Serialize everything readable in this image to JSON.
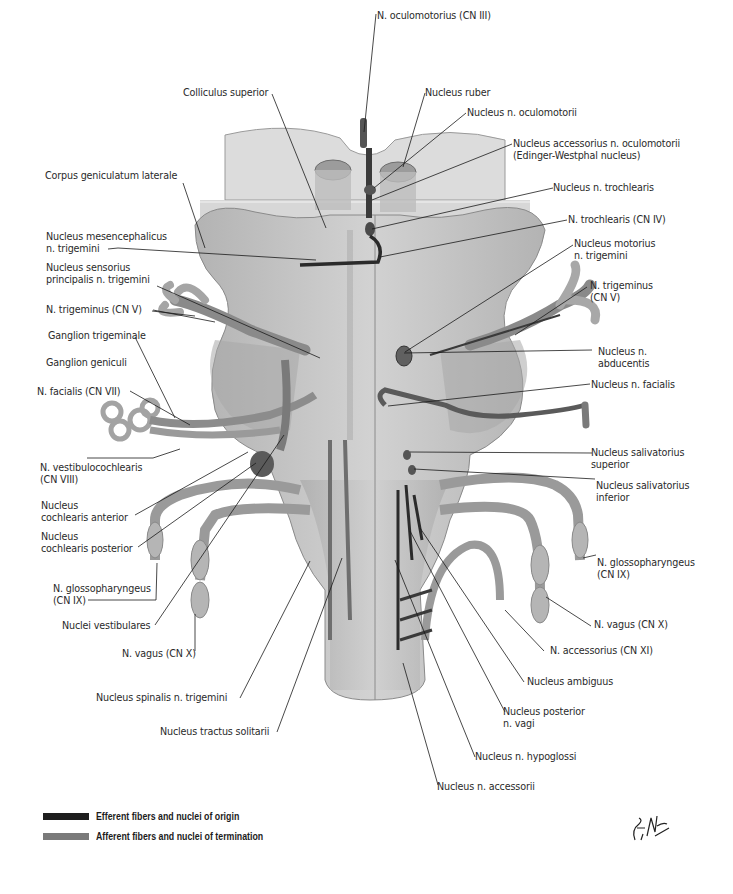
{
  "figure": {
    "labels": {
      "n_oculomotorius": "N. oculomotorius (CN III)",
      "nucleus_ruber": "Nucleus ruber",
      "nucleus_n_oculomotorii": "Nucleus n. oculomotorii",
      "nucleus_accessorius_1": "Nucleus accessorius n. oculomotorii",
      "nucleus_accessorius_2": "(Edinger-Westphal nucleus)",
      "colliculus_superior": "Colliculus superior",
      "corpus_geniculatum": "Corpus geniculatum laterale",
      "nucleus_n_trochlearis": "Nucleus n. trochlearis",
      "n_trochlearis": "N.  trochlearis (CN IV)",
      "nucleus_mesencephalicus_1": "Nucleus mesencephalicus",
      "nucleus_mesencephalicus_2": "n. trigemini",
      "nucleus_motorius_1": "Nucleus motorius",
      "nucleus_motorius_2": "n. trigemini",
      "nucleus_sensorius_1": "Nucleus sensorius",
      "nucleus_sensorius_2": "principalis n. trigemini",
      "n_trigeminus_left": "N. trigeminus (CN V)",
      "n_trigeminus_right_1": "N. trigeminus",
      "n_trigeminus_right_2": "(CN V)",
      "ganglion_trigeminale": "Ganglion trigeminale",
      "ganglion_geniculi": "Ganglion geniculi",
      "nucleus_abducentis_1": "Nucleus n.",
      "nucleus_abducentis_2": "abducentis",
      "n_facialis": "N. facialis (CN VII)",
      "nucleus_n_facialis": "Nucleus n. facialis",
      "n_vestibulocochlearis_1": "N. vestibulocochlearis",
      "n_vestibulocochlearis_2": "(CN VIII)",
      "nucleus_salivatorius_sup_1": "Nucleus salivatorius",
      "nucleus_salivatorius_sup_2": "superior",
      "nucleus_salivatorius_inf_1": "Nucleus salivatorius",
      "nucleus_salivatorius_inf_2": "inferior",
      "nucleus_cochlearis_ant_1": "Nucleus",
      "nucleus_cochlearis_ant_2": "cochlearis anterior",
      "nucleus_cochlearis_post_1": "Nucleus",
      "nucleus_cochlearis_post_2": "cochlearis posterior",
      "n_glossopharyngeus_left_1": "N. glossopharyngeus",
      "n_glossopharyngeus_left_2": "(CN IX)",
      "n_glossopharyngeus_right_1": "N. glossopharyngeus",
      "n_glossopharyngeus_right_2": "(CN IX)",
      "nuclei_vestibulares": "Nuclei vestibulares",
      "n_vagus_left": "N. vagus (CN X)",
      "n_vagus_right": "N. vagus (CN X)",
      "n_accessorius": "N. accessorius (CN XI)",
      "nucleus_ambiguus": "Nucleus ambiguus",
      "nucleus_spinalis": "Nucleus spinalis n. trigemini",
      "nucleus_posterior_vagi_1": "Nucleus posterior",
      "nucleus_posterior_vagi_2": "n. vagi",
      "nucleus_tractus_solitarii": "Nucleus tractus solitarii",
      "nucleus_n_hypoglossi": "Nucleus n. hypoglossi",
      "nucleus_n_accessorii": "Nucleus n. accessorii"
    }
  },
  "legend": {
    "items": [
      {
        "label": "Efferent fibers and nuclei of origin",
        "color": "#1e1e1e"
      },
      {
        "label": "Afferent fibers and nuclei of termination",
        "color": "#7a7a7a"
      }
    ]
  },
  "colors": {
    "tissue": "#c9c9c9",
    "tissue_dark": "#a6a6a6",
    "section": "#d8d8d8",
    "efferent": "#1e1e1e",
    "afferent": "#7a7a7a",
    "leader": "#1a1a1a"
  }
}
